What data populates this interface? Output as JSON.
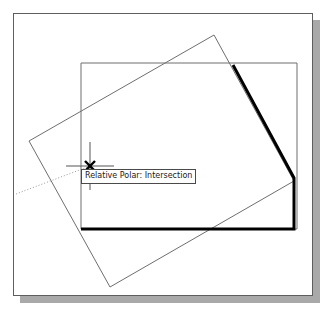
{
  "app": {
    "title": "CAD Drawing Area",
    "background_color": "#ffffff",
    "frame_border_color": "#5e5e5e",
    "shadow_color": "#a9a9a9"
  },
  "tooltip": {
    "text": "Relative Polar: Intersection",
    "border_color": "#4a4a4a",
    "background_color": "#ffffff",
    "text_color": "#1a1a1a"
  },
  "cursor": {
    "marker_name": "intersection-osnap-x-marker",
    "x": 76,
    "y": 152,
    "crosshair_color": "#555555",
    "marker_color": "#000000"
  },
  "geometry": {
    "axis_rectangle": {
      "name": "axis-aligned-rectangle",
      "stroke_color": "#6e6e6e",
      "stroke_width": 1,
      "points": "67,49 283,49 283,215 67,215"
    },
    "rotated_rectangle": {
      "name": "rotated-rectangle",
      "stroke_color": "#6e6e6e",
      "stroke_width": 1,
      "points": "200,21 280,167 96,273 15,127"
    },
    "bold_polyline": {
      "name": "highlighted-polyline",
      "stroke_color": "#000000",
      "stroke_width": 3,
      "points": "67,215 280,215 280,164 219,51"
    },
    "tracking_vector": {
      "name": "polar-tracking-dotted-line",
      "stroke_color": "#9a9a9a",
      "stroke_width": 1,
      "dash": "1,2",
      "x1": 76,
      "y1": 152,
      "x2": 2,
      "y2": 180
    },
    "crosshair": {
      "name": "crosshair-lines",
      "stroke_color": "#555555",
      "horizontal": {
        "x1": 52,
        "y1": 152,
        "x2": 100,
        "y2": 152
      },
      "vertical": {
        "x1": 76,
        "y1": 128,
        "x2": 76,
        "y2": 176
      }
    }
  }
}
